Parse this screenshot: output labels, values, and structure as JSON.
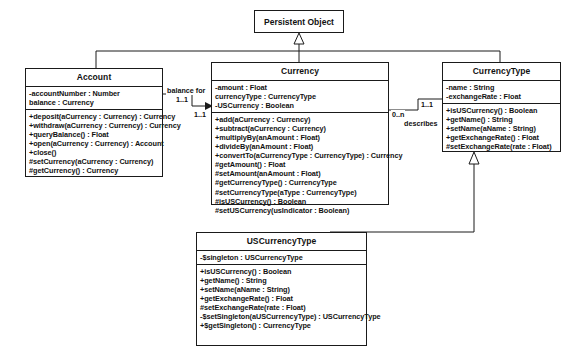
{
  "diagram": {
    "type": "uml-class-diagram"
  },
  "classes": {
    "persistent_object": {
      "name": "Persistent Object",
      "attributes": [],
      "operations": []
    },
    "account": {
      "name": "Account",
      "attributes": [
        "-accountNumber : Number",
        " balance : Currency"
      ],
      "operations": [
        "+deposit(aCurrency : Currency) : Currency",
        "+withdraw(aCurrency : Currency) : Currency",
        "+queryBalance() : Float",
        "+open(aCurrency : Currency) : Account",
        "+close()",
        "#setCurrency(aCurrency : Currency)",
        "#getCurrency() : Currency"
      ]
    },
    "currency": {
      "name": "Currency",
      "attributes": [
        "-amount : Float",
        " currencyType : CurrencyType",
        "-USCurrency : Boolean"
      ],
      "operations": [
        "+add(aCurrency : Currency)",
        "+subtract(aCurrency : Currency)",
        "+multiplyBy(anAmount : Float)",
        "+divideBy(anAmount : Float)",
        "+convertTo(aCurrencyType : CurrencyType) : Currency",
        "#getAmount() : Float",
        "#setAmount(anAmount : Float)",
        "#getCurrencyType() : CurrencyType",
        "#setCurrencyType(aType : CurrencyType)",
        "#isUSCurrency() : Boolean",
        "#setUSCurrency(usIndicator : Boolean)"
      ]
    },
    "currency_type": {
      "name": "CurrencyType",
      "attributes": [
        "-name : String",
        "-exchangeRate : Float"
      ],
      "operations": [
        "+isUSCurrency() : Boolean",
        "+getName() : String",
        "+setName(aName : String)",
        "+getExchangeRate() : Float",
        "#setExchangeRate(rate : Float)"
      ]
    },
    "us_currency_type": {
      "name": "USCurrencyType",
      "attributes": [
        "-$singleton : USCurrencyType"
      ],
      "operations": [
        "+isUSCurrency() : Boolean",
        "+getName() : String",
        "+setName(aName : String)",
        "+getExchangeRate() : Float",
        "#setExchangeRate(rate : Float)",
        "-$setSingleton(aUSCurrencyType) : USCurrencyType",
        "+$getSingleton() : CurrencyType"
      ]
    }
  },
  "associations": {
    "account_currency": {
      "label": "balance for",
      "source_multiplicity": "1..1",
      "target_multiplicity": "1..1"
    },
    "currency_currencytype": {
      "label": "describes",
      "source_multiplicity": "0..n",
      "target_multiplicity": "1..1"
    }
  },
  "generalizations": {
    "currency_to_persistent": {
      "from": "Currency",
      "to": "Persistent Object"
    },
    "currencytype_to_persistent": {
      "from": "CurrencyType",
      "to": "Persistent Object"
    },
    "uscurrencytype_to_currencytype": {
      "from": "USCurrencyType",
      "to": "CurrencyType"
    }
  },
  "colors": {
    "stroke": "#1a1a1a",
    "fill": "#ffffff",
    "text": "#111111"
  }
}
